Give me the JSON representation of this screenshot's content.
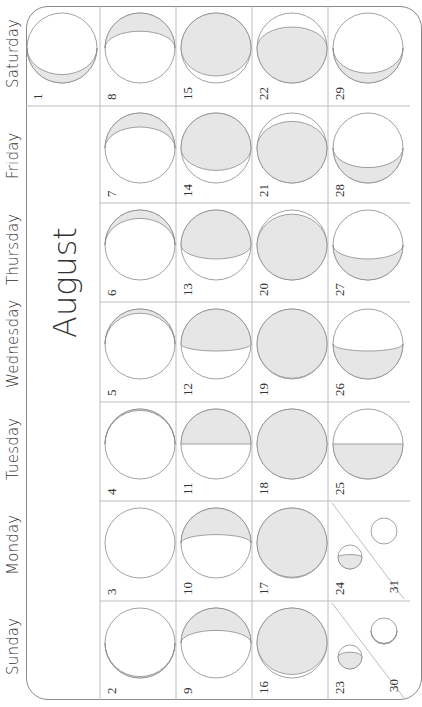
{
  "calendar": {
    "month": "August",
    "orientation": "rotated -90deg",
    "weekdays": [
      "Saturday",
      "Friday",
      "Thursday",
      "Wednesday",
      "Tuesday",
      "Monday",
      "Sunday"
    ],
    "colors": {
      "shade": "#e6e6e6",
      "line": "#8a8a8a",
      "text": "#333333"
    },
    "days": [
      {
        "day": 1,
        "weekday": "Saturday",
        "week": 0,
        "phase": "thin-crescent-bottom",
        "lit": 0.12
      },
      {
        "day": 2,
        "weekday": "Sunday",
        "week": 1,
        "phase": "new-thin-bottom",
        "lit": 0.02
      },
      {
        "day": 3,
        "weekday": "Monday",
        "week": 1,
        "phase": "new",
        "lit": 0.0
      },
      {
        "day": 4,
        "weekday": "Tuesday",
        "week": 1,
        "phase": "new-thin-top",
        "lit": 0.02
      },
      {
        "day": 5,
        "weekday": "Wednesday",
        "week": 1,
        "phase": "crescent-top",
        "lit": 0.06
      },
      {
        "day": 6,
        "weekday": "Thursday",
        "week": 1,
        "phase": "crescent-top",
        "lit": 0.12
      },
      {
        "day": 7,
        "weekday": "Friday",
        "week": 1,
        "phase": "crescent-top",
        "lit": 0.2
      },
      {
        "day": 8,
        "weekday": "Saturday",
        "week": 1,
        "phase": "crescent-top",
        "lit": 0.26
      },
      {
        "day": 9,
        "weekday": "Sunday",
        "week": 2,
        "phase": "crescent-top",
        "lit": 0.32
      },
      {
        "day": 10,
        "weekday": "Monday",
        "week": 2,
        "phase": "crescent-top",
        "lit": 0.38
      },
      {
        "day": 11,
        "weekday": "Tuesday",
        "week": 2,
        "phase": "first-quarter",
        "lit": 0.5
      },
      {
        "day": 12,
        "weekday": "Wednesday",
        "week": 2,
        "phase": "gibbous-top",
        "lit": 0.6
      },
      {
        "day": 13,
        "weekday": "Thursday",
        "week": 2,
        "phase": "gibbous-top",
        "lit": 0.7
      },
      {
        "day": 14,
        "weekday": "Friday",
        "week": 2,
        "phase": "gibbous-top",
        "lit": 0.82
      },
      {
        "day": 15,
        "weekday": "Saturday",
        "week": 2,
        "phase": "gibbous-top",
        "lit": 0.9
      },
      {
        "day": 16,
        "weekday": "Sunday",
        "week": 3,
        "phase": "gibbous-top",
        "lit": 0.95
      },
      {
        "day": 17,
        "weekday": "Monday",
        "week": 3,
        "phase": "full-ish",
        "lit": 0.99
      },
      {
        "day": 18,
        "weekday": "Tuesday",
        "week": 3,
        "phase": "full",
        "lit": 1.0
      },
      {
        "day": 19,
        "weekday": "Wednesday",
        "week": 3,
        "phase": "full-ish",
        "lit": 0.99
      },
      {
        "day": 20,
        "weekday": "Thursday",
        "week": 3,
        "phase": "gibbous-bottom",
        "lit": 0.94
      },
      {
        "day": 21,
        "weekday": "Friday",
        "week": 3,
        "phase": "gibbous-bottom",
        "lit": 0.88
      },
      {
        "day": 22,
        "weekday": "Saturday",
        "week": 3,
        "phase": "gibbous-bottom",
        "lit": 0.8
      },
      {
        "day": 23,
        "weekday": "Sunday",
        "week": 4,
        "phase": "gibbous-bottom",
        "lit": 0.7,
        "split": true
      },
      {
        "day": 24,
        "weekday": "Monday",
        "week": 4,
        "phase": "gibbous-bottom",
        "lit": 0.6,
        "split": true
      },
      {
        "day": 25,
        "weekday": "Tuesday",
        "week": 4,
        "phase": "last-quarter",
        "lit": 0.5
      },
      {
        "day": 26,
        "weekday": "Wednesday",
        "week": 4,
        "phase": "crescent-bottom",
        "lit": 0.4
      },
      {
        "day": 27,
        "weekday": "Thursday",
        "week": 4,
        "phase": "crescent-bottom",
        "lit": 0.3
      },
      {
        "day": 28,
        "weekday": "Friday",
        "week": 4,
        "phase": "crescent-bottom",
        "lit": 0.22
      },
      {
        "day": 29,
        "weekday": "Saturday",
        "week": 4,
        "phase": "crescent-bottom",
        "lit": 0.14
      },
      {
        "day": 30,
        "weekday": "Sunday",
        "week": 4,
        "phase": "new-thin-bottom",
        "lit": 0.03,
        "split": true
      },
      {
        "day": 31,
        "weekday": "Monday",
        "week": 4,
        "phase": "new",
        "lit": 0.0,
        "split": true
      }
    ]
  },
  "footer": {
    "mark": "..."
  }
}
